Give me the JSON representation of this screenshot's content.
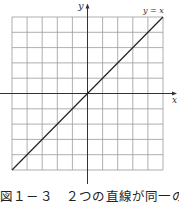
{
  "figure": {
    "y_axis_label": "y",
    "x_axis_label": "x",
    "line_label": "y = x",
    "caption": "図１－３　２つの直線が同一の場合",
    "grid": {
      "columns": 10,
      "rows": 10
    },
    "colors": {
      "grid": "#9a9a9a",
      "axis": "#333333",
      "line": "#222222"
    }
  }
}
